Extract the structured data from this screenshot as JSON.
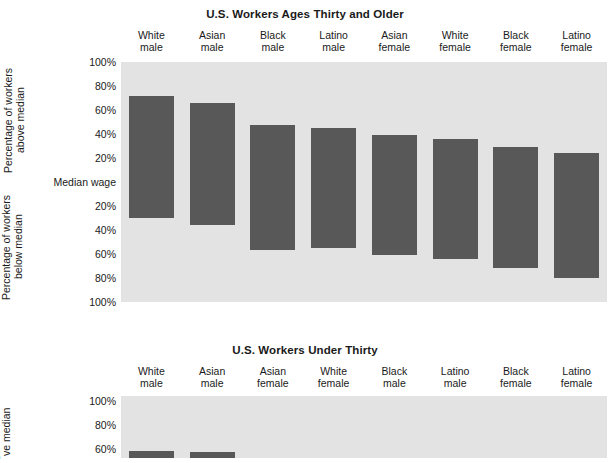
{
  "chart_data": [
    {
      "type": "bar",
      "title": "U.S. Workers Ages Thirty and Older",
      "xlabel": "",
      "ylabel_above": "Percentage of workers\nabove median",
      "ylabel_below": "Percentage of workers\nbelow median",
      "ytick_labels": [
        "100%",
        "80%",
        "60%",
        "40%",
        "20%",
        "Median wage",
        "20%",
        "40%",
        "60%",
        "80%",
        "100%"
      ],
      "ytick_values": [
        100,
        80,
        60,
        40,
        20,
        0,
        -20,
        -40,
        -60,
        -80,
        -100
      ],
      "ylim": [
        -100,
        100
      ],
      "grid": false,
      "legend": "none",
      "baseline_label": "Median wage",
      "categories": [
        "White\nmale",
        "Asian\nmale",
        "Black\nmale",
        "Latino\nmale",
        "Asian\nfemale",
        "White\nfemale",
        "Black\nfemale",
        "Latino\nfemale"
      ],
      "series": [
        {
          "name": "Percentage of workers above median",
          "values": [
            72,
            66,
            47.5,
            45,
            39,
            36,
            29,
            24
          ]
        },
        {
          "name": "Percentage of workers below median",
          "values": [
            30,
            36,
            57,
            55,
            61,
            64,
            72,
            80
          ]
        }
      ]
    },
    {
      "type": "bar",
      "title": "U.S. Workers Under Thirty",
      "xlabel": "",
      "ylabel_above": "Percentage of workers\nabove median",
      "ytick_labels": [
        "100%",
        "80%",
        "60%"
      ],
      "ytick_values": [
        100,
        80,
        60
      ],
      "ylim": [
        60,
        100
      ],
      "grid": false,
      "legend": "none",
      "categories": [
        "White\nmale",
        "Asian\nmale",
        "Asian\nfemale",
        "White\nfemale",
        "Black\nmale",
        "Latino\nmale",
        "Black\nfemale",
        "Latino\nfemale"
      ],
      "series": [
        {
          "name": "Percentage of workers above median",
          "values": [
            58,
            57.5,
            51.5,
            null,
            null,
            null,
            null,
            null
          ]
        }
      ],
      "note": "chart is cut off at the bottom edge of the screenshot"
    }
  ],
  "chart1": {
    "title": "U.S. Workers Ages Thirty and Older",
    "axis_label_above": "Percentage of workers\nabove median",
    "axis_label_below": "Percentage of workers\nbelow median",
    "categories": [
      "White\nmale",
      "Asian\nmale",
      "Black\nmale",
      "Latino\nmale",
      "Asian\nfemale",
      "White\nfemale",
      "Black\nfemale",
      "Latino\nfemale"
    ],
    "yticks": [
      "100%",
      "80%",
      "60%",
      "40%",
      "20%",
      "Median wage",
      "20%",
      "40%",
      "60%",
      "80%",
      "100%"
    ]
  },
  "chart2": {
    "title": "U.S. Workers Under Thirty",
    "axis_label_above": "age of workers\nve median",
    "categories": [
      "White\nmale",
      "Asian\nmale",
      "Asian\nfemale",
      "White\nfemale",
      "Black\nmale",
      "Latino\nmale",
      "Black\nfemale",
      "Latino\nfemale"
    ],
    "yticks": [
      "100%",
      "80%",
      "60%"
    ]
  },
  "colors": {
    "bar": "#585858",
    "plot_background": "#e3e3e3",
    "page_background": "#ffffff",
    "text": "#1a1a1a"
  }
}
